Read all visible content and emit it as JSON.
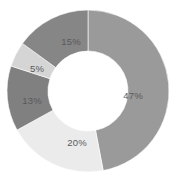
{
  "chart_data": {
    "type": "pie",
    "variant": "donut",
    "title": "",
    "subtitle": "",
    "xlabel": "",
    "ylabel": "",
    "grid": false,
    "legend": "none",
    "labels_shown": true,
    "label_format": "percent",
    "start_angle_deg": 0,
    "direction": "clockwise",
    "center": {
      "x": 88,
      "y": 91
    },
    "outer_radius": 81,
    "inner_radius": 40,
    "background_color": "#ffffff",
    "label_color": "#59595b",
    "categories": [
      "Segment 1",
      "Segment 2",
      "Segment 3",
      "Segment 4",
      "Segment 5"
    ],
    "values": [
      47,
      20,
      13,
      5,
      15
    ],
    "labels": [
      "47%",
      "20%",
      "13%",
      "5%",
      "15%"
    ],
    "colors": [
      "#9a9a9a",
      "#ebebeb",
      "#808080",
      "#d5d5d5",
      "#868686"
    ],
    "slices": [
      {
        "label": "47%",
        "value": 47,
        "color": "#9a9a9a",
        "start_deg": 0,
        "end_deg": 169.2,
        "label_x": 133,
        "label_y": 95
      },
      {
        "label": "20%",
        "value": 20,
        "color": "#ebebeb",
        "start_deg": 169.2,
        "end_deg": 241.2,
        "label_x": 77,
        "label_y": 142
      },
      {
        "label": "13%",
        "value": 13,
        "color": "#808080",
        "start_deg": 241.2,
        "end_deg": 288.0,
        "label_x": 32,
        "label_y": 100
      },
      {
        "label": "5%",
        "value": 5,
        "color": "#d5d5d5",
        "start_deg": 288.0,
        "end_deg": 306.0,
        "label_x": 37,
        "label_y": 68
      },
      {
        "label": "15%",
        "value": 15,
        "color": "#868686",
        "start_deg": 306.0,
        "end_deg": 360.0,
        "label_x": 71,
        "label_y": 41
      }
    ]
  }
}
